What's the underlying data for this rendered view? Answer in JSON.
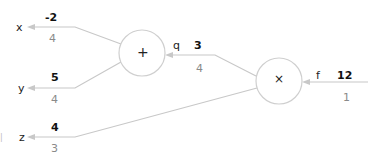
{
  "graph": {
    "inputs": {
      "x": {
        "label": "x",
        "value": "-2",
        "gradient": "4"
      },
      "y": {
        "label": "y",
        "value": "5",
        "gradient": "4"
      },
      "z": {
        "label": "z",
        "value": "4",
        "gradient": "3"
      }
    },
    "nodes": {
      "add": {
        "op": "+"
      },
      "mul": {
        "op": "×"
      }
    },
    "intermediate": {
      "q": {
        "label": "q",
        "value": "3",
        "gradient": "4"
      }
    },
    "output": {
      "f": {
        "label": "f",
        "value": "12",
        "gradient": "1"
      }
    },
    "margin_mark": "|"
  },
  "colors": {
    "edge": "#c8c8c8",
    "node_border": "#cfcfcf",
    "value_text": "#111111",
    "gradient_text": "#8a8a8a"
  }
}
